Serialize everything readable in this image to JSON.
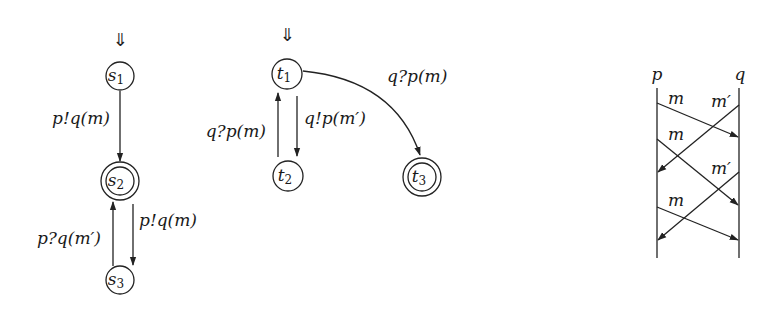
{
  "automaton_s": {
    "initial_marker": "⇓",
    "states": [
      {
        "id": "s1",
        "name": "s",
        "sub": "1",
        "accepting": false
      },
      {
        "id": "s2",
        "name": "s",
        "sub": "2",
        "accepting": true
      },
      {
        "id": "s3",
        "name": "s",
        "sub": "3",
        "accepting": false
      }
    ],
    "transitions": [
      {
        "from": "s1",
        "to": "s2",
        "label": "p!q(m)"
      },
      {
        "from": "s2",
        "to": "s3",
        "label": "p!q(m)"
      },
      {
        "from": "s3",
        "to": "s2",
        "label": "p?q(m′)"
      }
    ]
  },
  "automaton_t": {
    "initial_marker": "⇓",
    "states": [
      {
        "id": "t1",
        "name": "t",
        "sub": "1",
        "accepting": false
      },
      {
        "id": "t2",
        "name": "t",
        "sub": "2",
        "accepting": false
      },
      {
        "id": "t3",
        "name": "t",
        "sub": "3",
        "accepting": true
      }
    ],
    "transitions": [
      {
        "from": "t1",
        "to": "t2",
        "label": "q!p(m′)"
      },
      {
        "from": "t2",
        "to": "t1",
        "label": "q?p(m)"
      },
      {
        "from": "t1",
        "to": "t3",
        "label": "q?p(m)"
      }
    ]
  },
  "sequence_diagram": {
    "processes": [
      "p",
      "q"
    ],
    "messages": [
      {
        "from": "p",
        "to": "q",
        "label": "m"
      },
      {
        "from": "q",
        "to": "p",
        "label": "m′"
      },
      {
        "from": "p",
        "to": "q",
        "label": "m"
      },
      {
        "from": "q",
        "to": "p",
        "label": "m′"
      },
      {
        "from": "p",
        "to": "q",
        "label": "m"
      }
    ]
  }
}
